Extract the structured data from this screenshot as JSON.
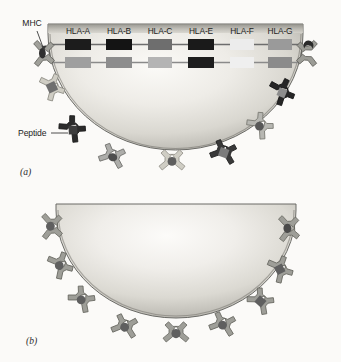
{
  "figure": {
    "panels": [
      {
        "tag": "(a)",
        "description": "Cell displaying polymorphic MHC class I molecules encoded by HLA genes; each receptor holds a peptide",
        "annotations": {
          "mhc_label": "MHC",
          "peptide_label": "Peptide"
        },
        "gene_map": {
          "loci": [
            "HLA-A",
            "HLA-B",
            "HLA-C",
            "HLA-E",
            "HLA-F",
            "HLA-G"
          ],
          "haplotypes": [
            {
              "name": "maternal",
              "alleles": [
                {
                  "locus": "HLA-A",
                  "shade": "#1c1c1c"
                },
                {
                  "locus": "HLA-B",
                  "shade": "#141414"
                },
                {
                  "locus": "HLA-C",
                  "shade": "#6e6e6e"
                },
                {
                  "locus": "HLA-E",
                  "shade": "#1a1a1a"
                },
                {
                  "locus": "HLA-F",
                  "shade": "#ececec"
                },
                {
                  "locus": "HLA-G",
                  "shade": "#9a9a9a"
                }
              ]
            },
            {
              "name": "paternal",
              "alleles": [
                {
                  "locus": "HLA-A",
                  "shade": "#9f9f9f"
                },
                {
                  "locus": "HLA-B",
                  "shade": "#8d8d8d"
                },
                {
                  "locus": "HLA-C",
                  "shade": "#b4b4b4"
                },
                {
                  "locus": "HLA-E",
                  "shade": "#1e1e1e"
                },
                {
                  "locus": "HLA-F",
                  "shade": "#efefef"
                },
                {
                  "locus": "HLA-G",
                  "shade": "#8b8b8b"
                }
              ]
            }
          ]
        },
        "receptors": [
          {
            "id": "r1",
            "shade": "#8f8f8f",
            "peptide": "oval",
            "peptide_shade": "#2a2a2a"
          },
          {
            "id": "r2",
            "shade": "#c9c6bd",
            "peptide": "square",
            "peptide_shade": "#6a6a6a"
          },
          {
            "id": "r3",
            "shade": "#2c2c2c",
            "peptide": "diamond",
            "peptide_shade": "#3a3a3a"
          },
          {
            "id": "r4",
            "shade": "#a8a8a8",
            "peptide": "oval",
            "peptide_shade": "#4a4a4a"
          },
          {
            "id": "r5",
            "shade": "#c9c6bd",
            "peptide": "round",
            "peptide_shade": "#5c5c5c"
          },
          {
            "id": "r6",
            "shade": "#3a3a3a",
            "peptide": "square",
            "peptide_shade": "#777777"
          },
          {
            "id": "r7",
            "shade": "#b5b5b5",
            "peptide": "round",
            "peptide_shade": "#555555"
          },
          {
            "id": "r8",
            "shade": "#272727",
            "peptide": "diamond",
            "peptide_shade": "#8a8a8a"
          },
          {
            "id": "r9",
            "shade": "#9a9a9a",
            "peptide": "crescent",
            "peptide_shade": "#2a2a2a"
          }
        ]
      },
      {
        "tag": "(b)",
        "description": "Cell displaying a single uniform type of MHC molecule; all receptors identical",
        "receptors": [
          {
            "id": "s1",
            "shade": "#9c9c9c",
            "peptide": "round",
            "peptide_shade": "#5e5e5e"
          },
          {
            "id": "s2",
            "shade": "#9c9c9c",
            "peptide": "round",
            "peptide_shade": "#5e5e5e"
          },
          {
            "id": "s3",
            "shade": "#9c9c9c",
            "peptide": "round",
            "peptide_shade": "#5e5e5e"
          },
          {
            "id": "s4",
            "shade": "#9c9c9c",
            "peptide": "round",
            "peptide_shade": "#5e5e5e"
          },
          {
            "id": "s5",
            "shade": "#9c9c9c",
            "peptide": "round",
            "peptide_shade": "#5e5e5e"
          },
          {
            "id": "s6",
            "shade": "#9c9c9c",
            "peptide": "round",
            "peptide_shade": "#5e5e5e"
          },
          {
            "id": "s7",
            "shade": "#9c9c9c",
            "peptide": "square",
            "peptide_shade": "#5e5e5e"
          },
          {
            "id": "s8",
            "shade": "#9c9c9c",
            "peptide": "square",
            "peptide_shade": "#5e5e5e"
          },
          {
            "id": "s9",
            "shade": "#9c9c9c",
            "peptide": "round",
            "peptide_shade": "#5e5e5e"
          }
        ]
      }
    ],
    "colors": {
      "cell_edge": "#5b5b5b",
      "cell_light": "#f3f2ee",
      "cell_mid": "#c6c4bd",
      "background": "#fbfaf8",
      "ink": "#1d1d1d"
    }
  }
}
